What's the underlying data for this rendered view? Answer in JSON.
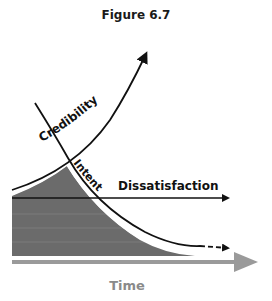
{
  "figure": {
    "title": "Figure 6.7"
  },
  "labels": {
    "credibility": "Credibility",
    "intent": "Intent",
    "dissatisfaction": "Dissatisfaction",
    "time": "Time"
  },
  "colors": {
    "line": "#111111",
    "shaded_area": "#6b6b6b",
    "time_axis": "#9a9a9a",
    "time_label": "#8a8a8a"
  }
}
